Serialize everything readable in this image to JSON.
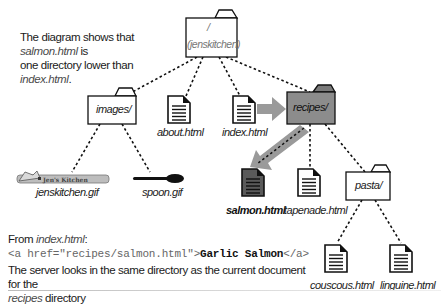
{
  "caption_top": {
    "part1": "The diagram shows that ",
    "file1": "salmon.html",
    "part2": " is",
    "part3": "one directory lower than ",
    "file2": "index.html",
    "part4": "."
  },
  "tree": {
    "root": {
      "name": "/",
      "subname": "(jenskitchen)"
    },
    "folders": [
      {
        "id": "images",
        "label": "images/"
      },
      {
        "id": "recipes",
        "label": "recipes/",
        "highlight": true
      },
      {
        "id": "pasta",
        "label": "pasta/"
      }
    ],
    "files": [
      {
        "id": "about",
        "label": "about.html"
      },
      {
        "id": "index",
        "label": "index.html"
      },
      {
        "id": "jenskitchen_gif",
        "label": "jenskitchen.gif",
        "image_text": "Jen's Kitchen"
      },
      {
        "id": "spoon_gif",
        "label": "spoon.gif"
      },
      {
        "id": "salmon",
        "label": "salmon.html",
        "highlight": true
      },
      {
        "id": "tapenade",
        "label": "tapenade.html"
      },
      {
        "id": "couscous",
        "label": "couscous.html"
      },
      {
        "id": "linguine",
        "label": "linguine.html"
      }
    ]
  },
  "example": {
    "from_prefix": "From ",
    "from_file": "index.html",
    "from_suffix": ":",
    "code_open": "<a href=\"recipes/salmon.html\">",
    "code_text": "Garlic Salmon",
    "code_close": "</a>",
    "note_line1": "The server looks in the same directory as the current document for the",
    "note_dir": "recipes",
    "note_line2": " directory"
  },
  "colors": {
    "highlight_folder": "#8c8c8c",
    "highlight_doc": "#555555",
    "arrow": "#9a9a9a",
    "line": "#111111"
  }
}
